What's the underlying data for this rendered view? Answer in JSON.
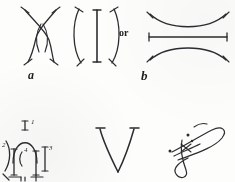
{
  "page": {
    "width": 235,
    "height": 182,
    "background_color": "#fdfdfc",
    "ink_color": "#2c2c30"
  },
  "figures": [
    {
      "id": "figure-a",
      "name": "crossing-arcs-lens",
      "label": "a",
      "label_style": "italic-bold",
      "description": "Two arcs crossing at top and bottom forming a lens/X shape, each stroke ending in a short tick"
    },
    {
      "id": "figure-a-alt",
      "name": "opposed-arcs-with-bar",
      "label": "",
      "description": "Two arcs bowing away from each other ) ( with a vertical bar between them, ticked ends"
    },
    {
      "id": "connector-or",
      "name": "or-connector",
      "label": "or"
    },
    {
      "id": "figure-b",
      "name": "stacked-arcs-with-horizontal-bar",
      "label": "b",
      "label_style": "italic-bold",
      "description": "Arc bowing downward above, horizontal ticked bar in middle, arc bowing upward below"
    },
    {
      "id": "figure-numbered",
      "name": "numbered-arc-diagram",
      "label": "",
      "numbers": [
        "1",
        "2",
        "3",
        "4"
      ],
      "description": "Bridge-like arch over two vertical strokes with bracket arcs, segments numbered 1 through 4"
    },
    {
      "id": "figure-v",
      "name": "letter-v-mark",
      "label": "V",
      "description": "Large hand-drawn letter V with serif ticks at the tops"
    },
    {
      "id": "figure-flourish",
      "name": "calligraphic-flourish",
      "label": "",
      "description": "Ornate looping pen flourish resembling a signature with dots"
    }
  ],
  "labels": {
    "a": "a",
    "b": "b",
    "or": "or",
    "n1": "1",
    "n2": "2",
    "n3": "3",
    "n4": "4"
  }
}
